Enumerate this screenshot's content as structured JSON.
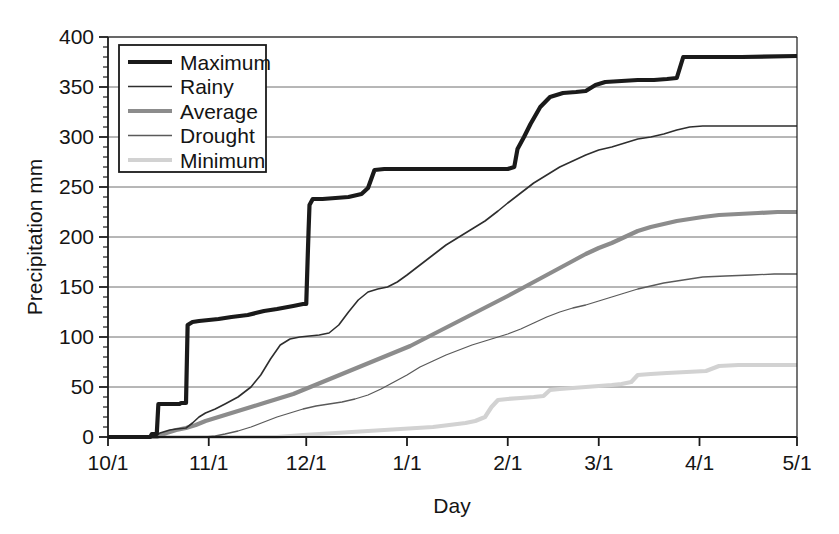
{
  "chart_data": {
    "type": "line",
    "title": "",
    "xlabel": "Day",
    "ylabel": "Precipitation mm",
    "grid": true,
    "legend_position": "top-left",
    "xlim": [
      0,
      212
    ],
    "ylim": [
      0,
      400
    ],
    "ytick_step": 50,
    "yminor_step": 10,
    "yticks": [
      0,
      50,
      100,
      150,
      200,
      250,
      300,
      350,
      400
    ],
    "ytick_labels": [
      "0",
      "50",
      "100",
      "150",
      "200",
      "250",
      "300",
      "350",
      "400"
    ],
    "xticks": [
      0,
      31,
      61,
      92,
      123,
      151,
      182,
      212
    ],
    "xtick_labels": [
      "10/1",
      "11/1",
      "12/1",
      "1/1",
      "2/1",
      "3/1",
      "4/1",
      "5/1"
    ],
    "x_unit": "days since 10/1",
    "series": [
      {
        "name": "Maximum",
        "color": "#1a1a1a",
        "width": 4.2,
        "final_value": 380,
        "points": [
          [
            0,
            0
          ],
          [
            13,
            0
          ],
          [
            13.5,
            3
          ],
          [
            15,
            3
          ],
          [
            15.5,
            33
          ],
          [
            22,
            33
          ],
          [
            22.5,
            34
          ],
          [
            24,
            34
          ],
          [
            24.5,
            112
          ],
          [
            26,
            115
          ],
          [
            28,
            116
          ],
          [
            31,
            117
          ],
          [
            34,
            118
          ],
          [
            38,
            120
          ],
          [
            43,
            122
          ],
          [
            48,
            126
          ],
          [
            52,
            128
          ],
          [
            57,
            131
          ],
          [
            60,
            133
          ],
          [
            61,
            133
          ],
          [
            61.4,
            175
          ],
          [
            61.7,
            205
          ],
          [
            62,
            232
          ],
          [
            63,
            238
          ],
          [
            66,
            238
          ],
          [
            70,
            239
          ],
          [
            74,
            240
          ],
          [
            78,
            243
          ],
          [
            80,
            249
          ],
          [
            82,
            267
          ],
          [
            85,
            268
          ],
          [
            92,
            268
          ],
          [
            100,
            268
          ],
          [
            110,
            268
          ],
          [
            118,
            268
          ],
          [
            123,
            268
          ],
          [
            125,
            270
          ],
          [
            126,
            288
          ],
          [
            128,
            300
          ],
          [
            130,
            313
          ],
          [
            133,
            330
          ],
          [
            136,
            340
          ],
          [
            140,
            344
          ],
          [
            144,
            345
          ],
          [
            147,
            346
          ],
          [
            150,
            352
          ],
          [
            153,
            355
          ],
          [
            158,
            356
          ],
          [
            163,
            357
          ],
          [
            168,
            357
          ],
          [
            172,
            358
          ],
          [
            175,
            359
          ],
          [
            177,
            380
          ],
          [
            182,
            380
          ],
          [
            195,
            380
          ],
          [
            212,
            381
          ]
        ]
      },
      {
        "name": "Rainy",
        "color": "#2e2e2e",
        "width": 1.6,
        "final_value": 311,
        "points": [
          [
            0,
            0
          ],
          [
            14,
            0
          ],
          [
            16,
            4
          ],
          [
            19,
            7
          ],
          [
            21,
            8
          ],
          [
            24,
            9
          ],
          [
            26,
            14
          ],
          [
            28,
            20
          ],
          [
            30,
            24
          ],
          [
            33,
            28
          ],
          [
            36,
            33
          ],
          [
            40,
            40
          ],
          [
            44,
            50
          ],
          [
            47,
            62
          ],
          [
            50,
            78
          ],
          [
            53,
            92
          ],
          [
            56,
            98
          ],
          [
            59,
            100
          ],
          [
            62,
            101
          ],
          [
            65,
            102
          ],
          [
            68,
            104
          ],
          [
            71,
            112
          ],
          [
            74,
            125
          ],
          [
            77,
            137
          ],
          [
            80,
            145
          ],
          [
            83,
            148
          ],
          [
            86,
            150
          ],
          [
            89,
            155
          ],
          [
            92,
            162
          ],
          [
            96,
            172
          ],
          [
            100,
            182
          ],
          [
            104,
            192
          ],
          [
            108,
            200
          ],
          [
            112,
            208
          ],
          [
            116,
            216
          ],
          [
            120,
            226
          ],
          [
            123,
            234
          ],
          [
            127,
            244
          ],
          [
            131,
            254
          ],
          [
            135,
            262
          ],
          [
            139,
            270
          ],
          [
            143,
            276
          ],
          [
            147,
            282
          ],
          [
            151,
            287
          ],
          [
            155,
            290
          ],
          [
            159,
            294
          ],
          [
            163,
            298
          ],
          [
            167,
            300
          ],
          [
            171,
            303
          ],
          [
            175,
            307
          ],
          [
            179,
            310
          ],
          [
            183,
            311
          ],
          [
            190,
            311
          ],
          [
            200,
            311
          ],
          [
            212,
            311
          ]
        ]
      },
      {
        "name": "Average",
        "color": "#8c8c8c",
        "width": 4.2,
        "final_value": 225,
        "points": [
          [
            0,
            0
          ],
          [
            15,
            0
          ],
          [
            18,
            4
          ],
          [
            21,
            7
          ],
          [
            24,
            9
          ],
          [
            27,
            12
          ],
          [
            30,
            16
          ],
          [
            33,
            19
          ],
          [
            36,
            22
          ],
          [
            39,
            25
          ],
          [
            42,
            28
          ],
          [
            45,
            31
          ],
          [
            48,
            34
          ],
          [
            51,
            37
          ],
          [
            54,
            40
          ],
          [
            57,
            43
          ],
          [
            60,
            47
          ],
          [
            63,
            51
          ],
          [
            66,
            55
          ],
          [
            69,
            59
          ],
          [
            72,
            63
          ],
          [
            75,
            67
          ],
          [
            78,
            71
          ],
          [
            81,
            75
          ],
          [
            84,
            79
          ],
          [
            87,
            83
          ],
          [
            90,
            87
          ],
          [
            93,
            91
          ],
          [
            96,
            96
          ],
          [
            99,
            101
          ],
          [
            102,
            106
          ],
          [
            105,
            111
          ],
          [
            108,
            116
          ],
          [
            111,
            121
          ],
          [
            114,
            126
          ],
          [
            117,
            131
          ],
          [
            120,
            136
          ],
          [
            123,
            141
          ],
          [
            127,
            148
          ],
          [
            131,
            155
          ],
          [
            135,
            162
          ],
          [
            139,
            169
          ],
          [
            143,
            176
          ],
          [
            147,
            183
          ],
          [
            151,
            189
          ],
          [
            155,
            194
          ],
          [
            159,
            200
          ],
          [
            163,
            206
          ],
          [
            167,
            210
          ],
          [
            171,
            213
          ],
          [
            175,
            216
          ],
          [
            179,
            218
          ],
          [
            183,
            220
          ],
          [
            188,
            222
          ],
          [
            194,
            223
          ],
          [
            200,
            224
          ],
          [
            206,
            225
          ],
          [
            212,
            225
          ]
        ]
      },
      {
        "name": "Drought",
        "color": "#5a5a5a",
        "width": 1.3,
        "final_value": 163,
        "points": [
          [
            0,
            0
          ],
          [
            30,
            0
          ],
          [
            33,
            1
          ],
          [
            36,
            3
          ],
          [
            40,
            6
          ],
          [
            44,
            10
          ],
          [
            48,
            15
          ],
          [
            52,
            20
          ],
          [
            56,
            24
          ],
          [
            60,
            28
          ],
          [
            64,
            31
          ],
          [
            68,
            33
          ],
          [
            72,
            35
          ],
          [
            76,
            38
          ],
          [
            80,
            42
          ],
          [
            84,
            48
          ],
          [
            88,
            55
          ],
          [
            92,
            62
          ],
          [
            96,
            70
          ],
          [
            100,
            76
          ],
          [
            104,
            82
          ],
          [
            108,
            87
          ],
          [
            112,
            92
          ],
          [
            116,
            96
          ],
          [
            120,
            100
          ],
          [
            123,
            103
          ],
          [
            127,
            108
          ],
          [
            131,
            114
          ],
          [
            135,
            120
          ],
          [
            139,
            125
          ],
          [
            143,
            129
          ],
          [
            147,
            132
          ],
          [
            151,
            136
          ],
          [
            155,
            140
          ],
          [
            159,
            144
          ],
          [
            163,
            148
          ],
          [
            167,
            151
          ],
          [
            171,
            154
          ],
          [
            175,
            156
          ],
          [
            179,
            158
          ],
          [
            183,
            160
          ],
          [
            190,
            161
          ],
          [
            198,
            162
          ],
          [
            205,
            163
          ],
          [
            212,
            163
          ]
        ]
      },
      {
        "name": "Minimum",
        "color": "#d2d2d2",
        "width": 4.2,
        "final_value": 72,
        "points": [
          [
            0,
            0
          ],
          [
            52,
            0
          ],
          [
            56,
            1
          ],
          [
            60,
            2
          ],
          [
            65,
            3
          ],
          [
            70,
            4
          ],
          [
            75,
            5
          ],
          [
            80,
            6
          ],
          [
            85,
            7
          ],
          [
            90,
            8
          ],
          [
            95,
            9
          ],
          [
            100,
            10
          ],
          [
            105,
            12
          ],
          [
            110,
            14
          ],
          [
            113,
            16
          ],
          [
            116,
            20
          ],
          [
            118,
            30
          ],
          [
            120,
            37
          ],
          [
            123,
            38
          ],
          [
            127,
            39
          ],
          [
            131,
            40
          ],
          [
            134,
            41
          ],
          [
            136,
            47
          ],
          [
            139,
            48
          ],
          [
            143,
            49
          ],
          [
            147,
            50
          ],
          [
            151,
            51
          ],
          [
            155,
            52
          ],
          [
            158,
            53
          ],
          [
            161,
            55
          ],
          [
            163,
            62
          ],
          [
            167,
            63
          ],
          [
            172,
            64
          ],
          [
            178,
            65
          ],
          [
            184,
            66
          ],
          [
            188,
            71
          ],
          [
            194,
            72
          ],
          [
            200,
            72
          ],
          [
            206,
            72
          ],
          [
            212,
            72
          ]
        ]
      }
    ]
  },
  "legend": {
    "items": [
      {
        "label": "Maximum"
      },
      {
        "label": "Rainy"
      },
      {
        "label": "Average"
      },
      {
        "label": "Drought"
      },
      {
        "label": "Minimum"
      }
    ]
  },
  "axes": {
    "y_title": "Precipitation mm",
    "x_title": "Day"
  },
  "colors": {
    "frame": "#1a1a1a",
    "grid": "#6e6e6e",
    "background": "#ffffff",
    "text": "#141414"
  }
}
